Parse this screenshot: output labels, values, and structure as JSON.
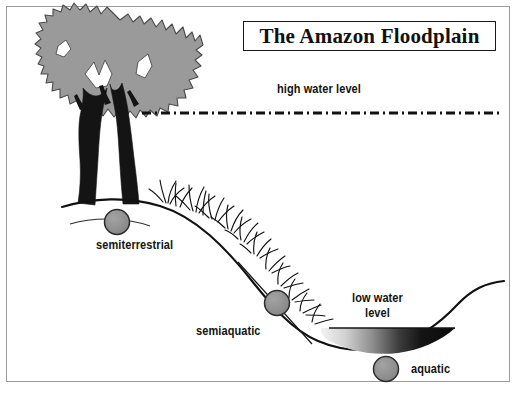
{
  "figure": {
    "title": "The Amazon Floodplain",
    "kind": "diagram",
    "background_color": "#ffffff",
    "frame_color": "#9b9b9b"
  },
  "labels": {
    "high_water": "high water level",
    "low_water_line1": "low water",
    "low_water_line2": "level",
    "semiterrestrial": "semiterrestrial",
    "semiaquatic": "semiaquatic",
    "aquatic": "aquatic"
  },
  "zones": [
    {
      "name": "semiterrestrial",
      "label": "semiterrestrial",
      "marker": "gray-circle"
    },
    {
      "name": "semiaquatic",
      "label": "semiaquatic",
      "marker": "gray-circle"
    },
    {
      "name": "aquatic",
      "label": "aquatic",
      "marker": "gray-circle"
    }
  ],
  "water_levels": [
    {
      "name": "high water level",
      "style": "dash-dot-line",
      "color": "#111111"
    },
    {
      "name": "low water level",
      "style": "filled-water-gradient",
      "color": "#101010"
    }
  ],
  "elements": {
    "tree": "tree-with-gray-canopy-and-dark-trunks",
    "grass": "grass-tufts-on-bank",
    "bank": "sloping-riverbank-curve",
    "water": "river-water-body"
  },
  "colors": {
    "canopy_fill": "#9a9a9a",
    "canopy_outline": "#3a3a3a",
    "trunk_fill": "#141414",
    "marker_fill": "#8f8f8f",
    "marker_outline": "#2b2b2b",
    "line_color": "#111111",
    "water_dark": "#0d0d0d",
    "water_light": "#e8e8e8",
    "text_color": "#131313"
  },
  "bottom_text": ""
}
